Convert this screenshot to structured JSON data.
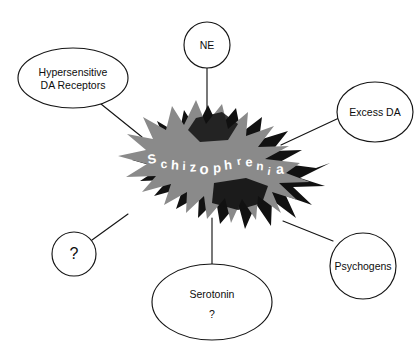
{
  "diagram": {
    "type": "concept-map",
    "background_color": "#ffffff",
    "line_color": "#151515",
    "center": {
      "label": "Schizophrenia",
      "letters": [
        "S",
        "c",
        "h",
        "i",
        "z",
        "o",
        "p",
        "h",
        "r",
        "e",
        "n",
        "i",
        "a"
      ],
      "text_color": "#ffffff",
      "burst_gray": "#8a8a8a",
      "burst_black": "#111111"
    },
    "nodes": [
      {
        "id": "hypersensitive-da-receptors",
        "shape": "ellipse",
        "lines": [
          "Hypersensitive",
          "DA Receptors"
        ],
        "cx": 73,
        "cy": 78,
        "rx": 55,
        "ry": 30,
        "font_size": 10.5
      },
      {
        "id": "ne",
        "shape": "ellipse",
        "lines": [
          "NE"
        ],
        "cx": 207,
        "cy": 45,
        "rx": 23,
        "ry": 23,
        "font_size": 10.5
      },
      {
        "id": "excess-da",
        "shape": "ellipse",
        "lines": [
          "Excess DA"
        ],
        "cx": 375,
        "cy": 112,
        "rx": 38,
        "ry": 30,
        "font_size": 10.5
      },
      {
        "id": "psychogens",
        "shape": "ellipse",
        "lines": [
          "Psychogens"
        ],
        "cx": 363,
        "cy": 266,
        "rx": 33,
        "ry": 33,
        "font_size": 10.5
      },
      {
        "id": "serotonin",
        "shape": "ellipse",
        "lines": [
          "Serotonin",
          "?"
        ],
        "cx": 212,
        "cy": 302,
        "rx": 60,
        "ry": 38,
        "font_size": 10.5
      },
      {
        "id": "unknown-left",
        "shape": "ellipse",
        "lines": [
          "?"
        ],
        "cx": 74,
        "cy": 254,
        "rx": 22,
        "ry": 22,
        "font_size": 16
      }
    ],
    "connectors": [
      {
        "id": "link-hypersensitive",
        "x1": 101,
        "y1": 104,
        "x2": 142,
        "y2": 137
      },
      {
        "id": "link-ne",
        "x1": 207,
        "y1": 68,
        "x2": 207,
        "y2": 123
      },
      {
        "id": "link-excess-da",
        "x1": 339,
        "y1": 118,
        "x2": 281,
        "y2": 145
      },
      {
        "id": "link-psychogens",
        "x1": 333,
        "y1": 241,
        "x2": 283,
        "y2": 221
      },
      {
        "id": "link-serotonin",
        "x1": 212,
        "y1": 264,
        "x2": 212,
        "y2": 218
      },
      {
        "id": "link-unknown-left",
        "x1": 92,
        "y1": 240,
        "x2": 128,
        "y2": 214
      }
    ]
  }
}
